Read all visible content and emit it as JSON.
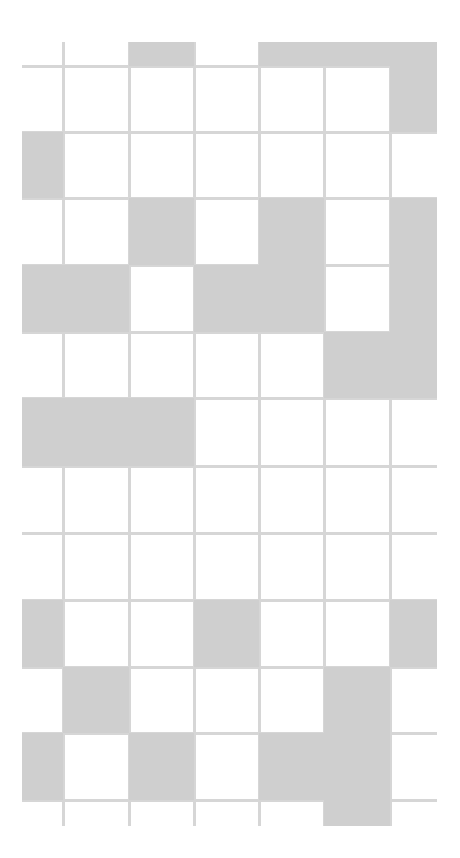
{
  "figure": {
    "colors": {
      "background": "#ffffff",
      "shaded": "#cfcfcf",
      "line": "#d6d6d6"
    },
    "col_edges": [
      22,
      63,
      129,
      194,
      259,
      324,
      390,
      437
    ],
    "row_edges": [
      42,
      66,
      132,
      198,
      265,
      332,
      398,
      466,
      533,
      600,
      667,
      733,
      800,
      826
    ],
    "shaded": [
      [
        0,
        2
      ],
      [
        0,
        4
      ],
      [
        0,
        5
      ],
      [
        0,
        6
      ],
      [
        1,
        6
      ],
      [
        2,
        0
      ],
      [
        3,
        2
      ],
      [
        3,
        4
      ],
      [
        3,
        6
      ],
      [
        4,
        0
      ],
      [
        4,
        1
      ],
      [
        4,
        3
      ],
      [
        4,
        4
      ],
      [
        4,
        6
      ],
      [
        5,
        5
      ],
      [
        5,
        6
      ],
      [
        6,
        0
      ],
      [
        6,
        1
      ],
      [
        6,
        2
      ],
      [
        9,
        0
      ],
      [
        9,
        3
      ],
      [
        9,
        6
      ],
      [
        10,
        1
      ],
      [
        10,
        5
      ],
      [
        11,
        0
      ],
      [
        11,
        2
      ],
      [
        11,
        4
      ],
      [
        11,
        5
      ],
      [
        12,
        5
      ]
    ],
    "h_lines": [
      {
        "y": 66,
        "x1": 22,
        "x2": 437
      },
      {
        "y": 132,
        "x1": 22,
        "x2": 437
      },
      {
        "y": 198,
        "x1": 22,
        "x2": 437
      },
      {
        "y": 265,
        "x1": 22,
        "x2": 437
      },
      {
        "y": 332,
        "x1": 22,
        "x2": 437
      },
      {
        "y": 398,
        "x1": 22,
        "x2": 437
      },
      {
        "y": 466,
        "x1": 22,
        "x2": 437
      },
      {
        "y": 533,
        "x1": 22,
        "x2": 437
      },
      {
        "y": 600,
        "x1": 22,
        "x2": 437
      },
      {
        "y": 667,
        "x1": 22,
        "x2": 437
      },
      {
        "y": 733,
        "x1": 22,
        "x2": 437
      },
      {
        "y": 800,
        "x1": 22,
        "x2": 437
      }
    ],
    "v_lines": [
      {
        "x": 63,
        "y1": 42,
        "y2": 826
      },
      {
        "x": 129,
        "y1": 42,
        "y2": 826
      },
      {
        "x": 194,
        "y1": 42,
        "y2": 826
      },
      {
        "x": 259,
        "y1": 42,
        "y2": 826
      },
      {
        "x": 324,
        "y1": 42,
        "y2": 826
      },
      {
        "x": 390,
        "y1": 66,
        "y2": 826
      }
    ]
  }
}
